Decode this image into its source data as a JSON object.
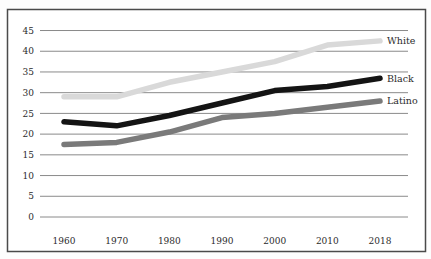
{
  "chart_data": {
    "type": "line",
    "title": "",
    "xlabel": "",
    "ylabel": "",
    "x": [
      "1960",
      "1970",
      "1980",
      "1990",
      "2000",
      "2010",
      "2018"
    ],
    "series": [
      {
        "name": "White",
        "color": "#d9d9d9",
        "values": [
          29,
          29,
          32.5,
          35,
          37.5,
          41.5,
          42.5
        ]
      },
      {
        "name": "Black",
        "color": "#141414",
        "values": [
          23,
          22,
          24.5,
          27.5,
          30.5,
          31.5,
          33.5
        ]
      },
      {
        "name": "Latino",
        "color": "#7a7a7a",
        "values": [
          17.5,
          18,
          20.5,
          24,
          25,
          26.5,
          28
        ]
      }
    ],
    "y_ticks": [
      45,
      40,
      35,
      30,
      25,
      20,
      15,
      10,
      5,
      0
    ],
    "ylim": [
      0,
      45
    ],
    "grid": true,
    "legend_position": "right-of-line-ends",
    "legend_labels": [
      "White",
      "Black",
      "Latino"
    ]
  },
  "style": {
    "frame_border_color": "#4a4a4a",
    "gridline_color": "#8a8a8a",
    "tick_label_color": "#2b2b2b",
    "background_color": "#ffffff"
  }
}
